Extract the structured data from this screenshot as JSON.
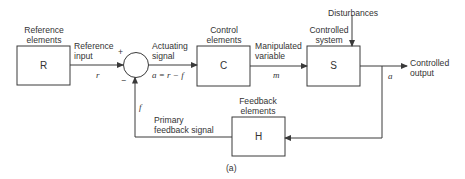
{
  "diagram": {
    "caption": "(a)",
    "blocks": {
      "reference": {
        "letter": "R",
        "label_line1": "Reference",
        "label_line2": "elements"
      },
      "control": {
        "letter": "C",
        "label_line1": "Control",
        "label_line2": "elements"
      },
      "system": {
        "letter": "S",
        "label_line1": "Controlled",
        "label_line2": "system"
      },
      "feedback": {
        "letter": "H",
        "label_line1": "Feedback",
        "label_line2": "elements"
      }
    },
    "junction": {
      "plus": "+",
      "minus": "−"
    },
    "signals": {
      "reference_input": {
        "line1": "Reference",
        "line2": "input",
        "symbol": "r"
      },
      "actuating": {
        "line1": "Actuating",
        "line2": "signal",
        "equation": "a = r − f"
      },
      "manipulated": {
        "line1": "Manipulated",
        "line2": "variable",
        "symbol": "m"
      },
      "disturbances": {
        "label": "Disturbances"
      },
      "controlled_output": {
        "line1": "Controlled",
        "line2": "output",
        "symbol": "a"
      },
      "primary_feedback": {
        "line1": "Primary",
        "line2": "feedback signal",
        "symbol": "f"
      }
    },
    "colors": {
      "line": "#3a3a3a",
      "background": "#ffffff"
    }
  }
}
